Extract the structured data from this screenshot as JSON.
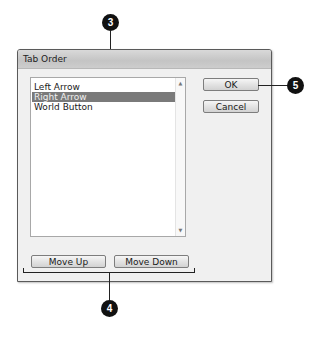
{
  "dialog": {
    "title": "Tab Order",
    "list": {
      "items": [
        {
          "label": "Left Arrow",
          "selected": false
        },
        {
          "label": "Right Arrow",
          "selected": true
        },
        {
          "label": "World Button",
          "selected": false
        }
      ],
      "scroll_up_icon": "▲",
      "scroll_down_icon": "▼"
    },
    "buttons": {
      "ok": "OK",
      "cancel": "Cancel",
      "move_up": "Move Up",
      "move_down": "Move Down"
    }
  },
  "callouts": {
    "c3": "3",
    "c4": "4",
    "c5": "5"
  },
  "colors": {
    "selection": "#7a7a7a",
    "callout": "#111111",
    "dialog_bg": "#f0f0f0"
  }
}
